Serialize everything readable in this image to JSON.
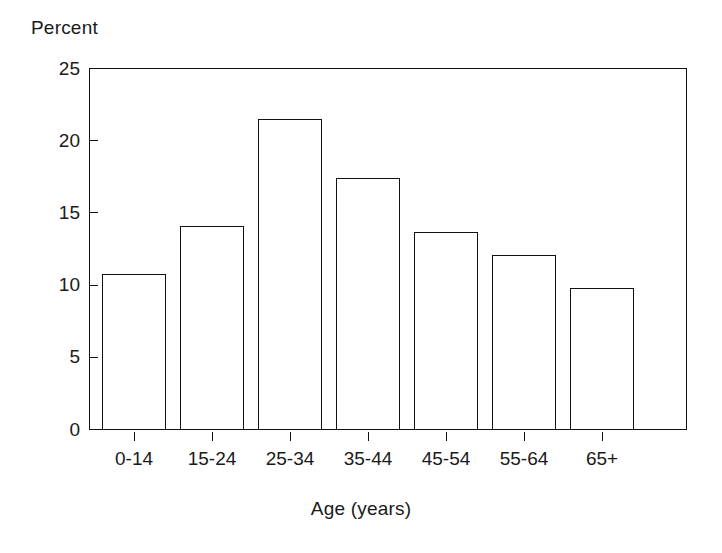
{
  "chart_data": {
    "type": "bar",
    "title": "",
    "subtitle": "",
    "xlabel": "Age (years)",
    "ylabel": "Percent",
    "categories": [
      "0-14",
      "15-24",
      "25-34",
      "35-44",
      "45-54",
      "55-64",
      "65+"
    ],
    "values": [
      10.8,
      14.1,
      21.5,
      17.4,
      13.7,
      12.1,
      9.8
    ],
    "ylim": [
      0,
      25
    ],
    "yticks": [
      0,
      5,
      10,
      15,
      20,
      25
    ],
    "ytick_labels": [
      "0",
      "5",
      "10",
      "15",
      "20",
      "25"
    ],
    "grid": false,
    "legend": null,
    "legend_position": "none",
    "annotations": [],
    "series": [
      {
        "name": "Percent",
        "values": [
          10.8,
          14.1,
          21.5,
          17.4,
          13.7,
          12.1,
          9.8
        ]
      }
    ],
    "style": {
      "bar_fill": "#ffffff",
      "bar_edge": "#111111",
      "axis_color": "#111111",
      "background": "#ffffff",
      "text_color": "#1a1a1a"
    }
  }
}
